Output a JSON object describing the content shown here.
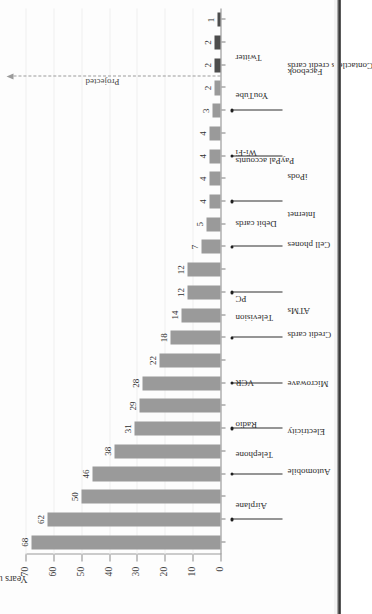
{
  "chart_data": {
    "type": "bar",
    "orientation": "vertical-rendered-rotated",
    "title": "",
    "xlabel": "",
    "ylabel": "Years until 50 million users",
    "ylim": [
      0,
      70
    ],
    "yticks": [
      0,
      10,
      20,
      30,
      40,
      50,
      60,
      70
    ],
    "ytick_labels": [
      "0",
      "10",
      "20",
      "30",
      "40",
      "50",
      "60",
      "70"
    ],
    "grid": true,
    "legend": null,
    "categories": [
      "Airplane",
      "Automobile",
      "Telephone",
      "Electricity",
      "Radio",
      "Microwave",
      "VCR",
      "Credit cards",
      "Television",
      "ATMs",
      "PC",
      "Cell phones",
      "Debit cards",
      "Internet",
      "PayPal accounts",
      "iPods",
      "Wi-Fi",
      "Contactless credit cards",
      "YouTube",
      "Facebook",
      "Twitter",
      "Mobile app banking",
      "NFC-enabled handsets",
      "E-paper/iPads"
    ],
    "values": [
      68,
      62,
      50,
      46,
      38,
      31,
      29,
      28,
      22,
      18,
      14,
      12,
      12,
      7,
      5,
      4,
      4,
      4,
      4,
      3,
      2,
      2,
      2,
      1
    ],
    "value_labels": [
      "68",
      "62",
      "50",
      "46",
      "38",
      "31",
      "29",
      "28",
      "22",
      "18",
      "14",
      "12",
      "12",
      "7",
      "5",
      "4",
      "4",
      "4",
      "4",
      "3",
      "2",
      "2",
      "2",
      "1"
    ],
    "series_groups": [
      {
        "name": "Actual",
        "color": "#9a9a9a",
        "from": 0,
        "to": 20
      },
      {
        "name": "Projected",
        "color": "#4d4d4d",
        "from": 21,
        "to": 23
      }
    ],
    "annotations": [
      {
        "name": "projected-divider",
        "label": "Projected",
        "after_category": "Twitter",
        "style": "dashed-arrow"
      }
    ],
    "colors": {
      "bar_actual": "#9a9a9a",
      "bar_projected": "#4d4d4d",
      "axis": "#8a8a8a",
      "grid": "#f0f0f0",
      "text": "#2f2f2f",
      "background": "#fdfdfd"
    }
  }
}
